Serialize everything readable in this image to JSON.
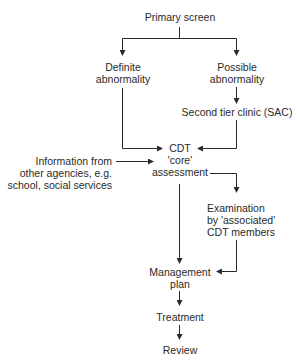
{
  "nodes": {
    "primary_screen": "Primary screen",
    "definite_abnormality": [
      "Definite",
      "abnormality"
    ],
    "possible_abnormality": [
      "Possible",
      "abnormality"
    ],
    "second_tier_clinic": "Second tier clinic (SAC)",
    "cdt_core_assessment": [
      "CDT",
      "'core'",
      "assessment"
    ],
    "information_from_agencies": [
      "Information from",
      "other agencies, e.g.",
      "school, social services"
    ],
    "examination_associated": [
      "Examination",
      "by 'associated'",
      "CDT members"
    ],
    "management_plan": [
      "Management",
      "plan"
    ],
    "treatment": "Treatment",
    "review": "Review"
  },
  "edges": [
    {
      "from": "Primary screen",
      "to": "Definite abnormality"
    },
    {
      "from": "Primary screen",
      "to": "Possible abnormality"
    },
    {
      "from": "Possible abnormality",
      "to": "Second tier clinic (SAC)"
    },
    {
      "from": "Definite abnormality",
      "to": "CDT 'core' assessment"
    },
    {
      "from": "Second tier clinic (SAC)",
      "to": "CDT 'core' assessment"
    },
    {
      "from": "Information from other agencies",
      "to": "CDT 'core' assessment"
    },
    {
      "from": "CDT 'core' assessment",
      "to": "Examination by 'associated' CDT members"
    },
    {
      "from": "CDT 'core' assessment",
      "to": "Management plan"
    },
    {
      "from": "Examination by 'associated' CDT members",
      "to": "Management plan"
    },
    {
      "from": "Management plan",
      "to": "Treatment"
    },
    {
      "from": "Treatment",
      "to": "Review"
    }
  ],
  "colors": {
    "line": "#2a2a2a",
    "text": "#2a2a2a",
    "background": "#ffffff"
  }
}
